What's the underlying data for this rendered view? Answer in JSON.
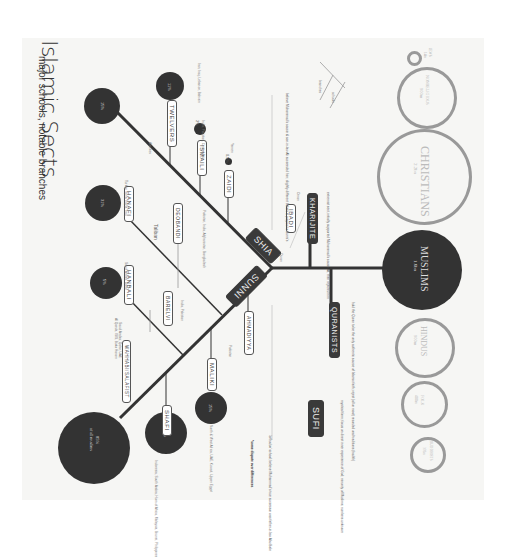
{
  "title": "Islamic Sects",
  "subtitle": "major schools, notable branches",
  "root": {
    "label": "MUSLIMS",
    "value": "1.6bn"
  },
  "world_religions": [
    {
      "label": "JEWS",
      "value": "14m"
    },
    {
      "label": "NONRELIGIOUS",
      "value": "900m"
    },
    {
      "label": "CHRISTIANS",
      "value": "2.2bn"
    },
    {
      "label": "MUSLIMS",
      "value": "1.6bn"
    },
    {
      "label": "HINDUS",
      "value": "900m"
    },
    {
      "label": "FOLK",
      "value": "400m"
    },
    {
      "label": "BUDDHISTS",
      "value": "376m"
    }
  ],
  "branches": {
    "sunni": {
      "label": "SUNNI",
      "share": "85%",
      "share_note": "of all muslims",
      "note": "'orthodox' school; believe Muhammad's true successor was father-in-law Abu Bakr"
    },
    "shia": {
      "label": "SHIA",
      "share": "15%",
      "note": "believe Muhammad's cousin & son-in-law Ali succeeded him; slightly different beliefs & prayers to Sunni's"
    },
    "kharijite": {
      "label": "KHARIJITE",
      "note": "extremist sect, initially supported Muhammad's cousin Ali, then rejected him"
    },
    "ibadi": {
      "label": "IBADI",
      "note": "Oman"
    },
    "quranists": {
      "label": "QURANISTS",
      "note": "hold the Quran to be the only authentic source of Islamic faith; reject (all or most) recorded oral traditions (hadith)"
    },
    "sufi": {
      "label": "SUFI",
      "note": "mystical form; focus on direct inner experience of God; minority of Muslims; numbers unknown"
    }
  },
  "sunni_schools": [
    {
      "label": "HANAFI",
      "share": "31%",
      "region": "Turkey, Syria, Egypt, Iraq"
    },
    {
      "label": "HANBALI",
      "share": "5%",
      "region": "Saudi Arabia, Qatar"
    },
    {
      "label": "SHAFI",
      "share": "16%",
      "region": "Indonesia, South Arabia, Horn of Africa, Malaysia, Brunei, Philippines"
    },
    {
      "label": "MALIKI",
      "share": "15%",
      "region": "North & West Africa, UAE, Kuwait, Upper Egypt"
    },
    {
      "label": "WAHHABI/SALAFIST",
      "region": "Saudi Arabia, Qatar, UAE"
    },
    {
      "label": "DEOBANDI",
      "region": "Pakistan, India, Afghanistan, Bangladesh"
    },
    {
      "label": "BARELVI",
      "region": "India, Pakistan"
    },
    {
      "label": "AHMADIYYA",
      "share": "1%",
      "region": "Pakistan"
    }
  ],
  "shia_schools": [
    {
      "label": "TWELVERS",
      "share": "11%",
      "region": "Iran, Iraq, Lebanon, Bahrain"
    },
    {
      "label": "ISMAILI",
      "share": "2%",
      "region": "India, Pakistan, Central Asia"
    },
    {
      "label": "ZAIDI",
      "share": "0.5%",
      "region": "Yemen"
    },
    {
      "label": "Alawites",
      "region": "Syria"
    }
  ],
  "extra_labels": {
    "taliban": "Taliban",
    "al_qaeda": "Al Qaeda, ISIS, Boko Haram",
    "scripture": "Quran",
    "legend_note": "*some dispute over differences",
    "legend_key": [
      "branches",
      "schools"
    ]
  }
}
